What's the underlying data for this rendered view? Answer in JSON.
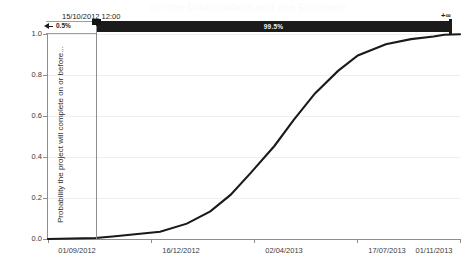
{
  "title_ghost": "on the Distribution and the Estimate",
  "chart_data": {
    "type": "line",
    "title": "",
    "xlabel": "",
    "ylabel": "Probability the project will complete on or before...",
    "ylim": [
      0.0,
      1.0
    ],
    "ytick_labels": [
      "0.0",
      "0.2",
      "0.4",
      "0.6",
      "0.8",
      "1.0"
    ],
    "ytick_values": [
      0.0,
      0.2,
      0.4,
      0.6,
      0.8,
      1.0
    ],
    "xtick_labels": [
      "01/09/2012",
      "16/12/2012",
      "02/04/2013",
      "17/07/2013",
      "01/11/2013"
    ],
    "xlim": [
      "01/09/2012",
      "01/11/2013"
    ],
    "grid": true,
    "legend": "none",
    "series": [
      {
        "name": "Cumulative probability (S-curve)",
        "x": [
          "01/09/2012",
          "15/10/2012",
          "01/11/2012",
          "16/12/2012",
          "10/01/2013",
          "01/02/2013",
          "20/02/2013",
          "10/03/2013",
          "02/04/2013",
          "20/04/2013",
          "10/05/2013",
          "01/06/2013",
          "20/06/2013",
          "17/07/2013",
          "10/08/2013",
          "01/09/2013",
          "01/10/2013",
          "01/11/2013"
        ],
        "values": [
          0.0,
          0.005,
          0.012,
          0.035,
          0.075,
          0.135,
          0.215,
          0.32,
          0.455,
          0.58,
          0.71,
          0.82,
          0.895,
          0.95,
          0.975,
          0.988,
          0.996,
          0.999
        ]
      }
    ],
    "annotations": {
      "marker_date": "15/10/2012 12:00",
      "left_percent": "0.5%",
      "right_percent": "99.5%",
      "right_bound": "+∞",
      "left_arrow": "left-arrow-icon",
      "marker_value": 0.005
    }
  },
  "axes": {
    "y_title": "Probability the project will complete on or before...",
    "y_ticks": [
      "1.0",
      "0.8",
      "0.6",
      "0.4",
      "0.2",
      "0.0"
    ],
    "x_ticks": [
      "01/09/2012",
      "16/12/2012",
      "02/04/2013",
      "17/07/2013",
      "01/11/2013"
    ]
  }
}
